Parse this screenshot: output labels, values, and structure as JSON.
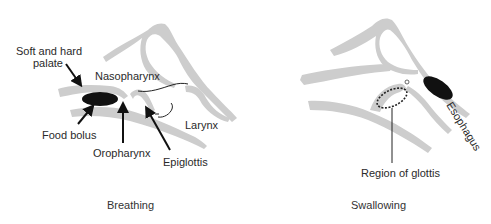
{
  "panels": [
    {
      "caption": "Breathing",
      "labels": {
        "palate_line1": "Soft and hard",
        "palate_line2": "palate",
        "nasopharynx": "Nasopharynx",
        "food_bolus": "Food bolus",
        "oropharynx": "Oropharynx",
        "epiglottis": "Epiglottis",
        "larynx": "Larynx"
      }
    },
    {
      "caption": "Swallowing",
      "labels": {
        "esophagus": "Esophagus",
        "region_of_glottis": "Region of glottis"
      }
    }
  ],
  "colors": {
    "tissue": "#cdcdcd",
    "bolus": "#111111",
    "text": "#2a2a2a"
  }
}
